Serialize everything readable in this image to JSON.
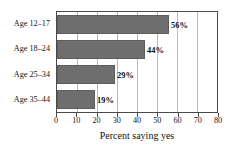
{
  "chart_data": {
    "type": "bar",
    "orientation": "horizontal",
    "title": "",
    "xlabel": "Percent saying yes",
    "ylabel": "",
    "categories": [
      "Age 12–17",
      "Age 18–24",
      "Age 25–34",
      "Age 35–44"
    ],
    "values": [
      56,
      44,
      29,
      19
    ],
    "value_labels": [
      "56%",
      "44%",
      "29%",
      "19%"
    ],
    "xlim": [
      0,
      80
    ],
    "xticks": [
      0,
      10,
      20,
      30,
      40,
      50,
      60,
      70,
      80
    ],
    "xtick_labels": [
      "0",
      "10",
      "20",
      "30",
      "40",
      "50",
      "60",
      "70",
      "80"
    ],
    "grid": "vertical",
    "legend": "none",
    "bar_color": "#6e6e6e",
    "bar_edge_color": "#5d5d5d",
    "gridline_color": "#b9b9b9",
    "axis_color": "#4a4a4a",
    "background": "#ffffff"
  }
}
